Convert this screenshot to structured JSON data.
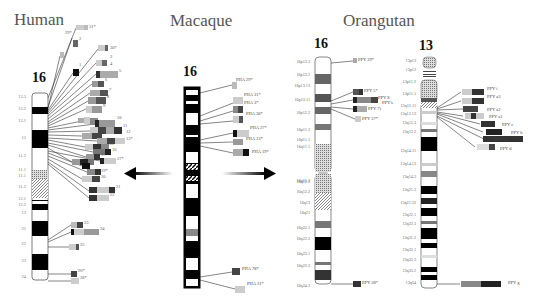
{
  "titles": {
    "human": "Human",
    "macaque": "Macaque",
    "orangutan": "Orangutan"
  },
  "chromosomes": {
    "human_16": {
      "number": "16",
      "bands": [
        "13.3",
        "13.2",
        "13.1",
        "12",
        "11.2",
        "11.1",
        "11.1",
        "11.2",
        "12.1",
        "12.2",
        "13",
        "21",
        "22",
        "23",
        "24"
      ],
      "segments": [
        "1",
        "2",
        "3",
        "4",
        "5",
        "6",
        "7",
        "8",
        "9",
        "10",
        "11",
        "12",
        "13",
        "14",
        "15",
        "16",
        "17",
        "18",
        "19",
        "20",
        "21",
        "22",
        "23",
        "24",
        "25",
        "26",
        "27",
        "28",
        "29",
        "30",
        "31"
      ],
      "visible_labels": [
        "31*",
        "29*",
        "30*",
        "2",
        "3",
        "4",
        "5",
        "6",
        "7",
        "8",
        "9",
        "10",
        "11",
        "12",
        "13*",
        "15",
        "16",
        "17",
        "18",
        "19*",
        "20",
        "21",
        "22",
        "23",
        "24",
        "25",
        "26",
        "27*",
        "28*"
      ]
    },
    "macaque_16": {
      "number": "16",
      "probes": [
        "PHA 29*",
        "PHA 31*",
        "PHA 3*",
        "PHA 30*",
        "PHA 27*",
        "PHA 13*",
        "PHA 19*",
        "PHA 78*",
        "PHA 31*"
      ]
    },
    "orangutan_16": {
      "number": "16",
      "bands": [
        "16p13.3",
        "16p13.2",
        "16p13.13",
        "16p13.11",
        "16p12.2",
        "16p11.2",
        "16p11.1",
        "16q11.1",
        "16q11.2",
        "16q12.1",
        "16q12.2",
        "16q13",
        "16q21",
        "16q22.1",
        "16q22.2",
        "16q23.1",
        "16q23.3",
        "16q24.3"
      ],
      "probes": [
        "PPY 29*",
        "PPY 5*",
        "PPY 8",
        "PPY 7)",
        "PPY 27*",
        "PPY 28*"
      ]
    },
    "orangutan_13": {
      "number": "13",
      "bands": [
        "13p13",
        "13p12",
        "13p11.2",
        "13p11.1",
        "13q12.11",
        "13q12.13",
        "13q12.3",
        "13q13.2",
        "13q14.11",
        "13q14.13",
        "13q14.3",
        "13q21.2",
        "13q21.32",
        "13q22.1",
        "13q22.3",
        "13q31.2",
        "13q32.1",
        "13q32.3",
        "13q33.2",
        "13q34"
      ],
      "probes": [
        "PPY i",
        "PPY a3",
        "PPY a2",
        "PPY a1",
        "PPY c",
        "PPY b",
        "PPY e",
        "PPY d",
        "PPY g"
      ]
    }
  },
  "side_label": "PPY's",
  "arrows": {
    "left": "left-arrow",
    "right": "right-arrow"
  }
}
